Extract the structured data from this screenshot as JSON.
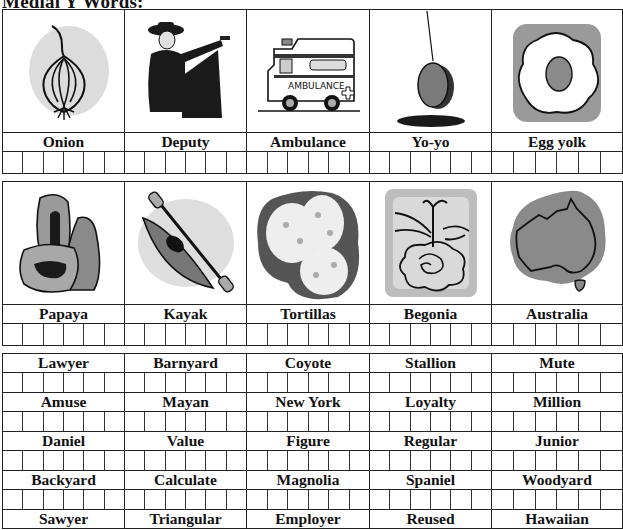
{
  "title": "Medial Y Words:",
  "picture_rows": [
    {
      "items": [
        {
          "label": "Onion",
          "icon": "onion-icon"
        },
        {
          "label": "Deputy",
          "icon": "deputy-icon"
        },
        {
          "label": "Ambulance",
          "icon": "ambulance-icon",
          "icon_text": "AMBULANCE"
        },
        {
          "label": "Yo-yo",
          "icon": "yoyo-icon"
        },
        {
          "label": "Egg yolk",
          "icon": "egg-yolk-icon"
        }
      ]
    },
    {
      "items": [
        {
          "label": "Papaya",
          "icon": "papaya-icon"
        },
        {
          "label": "Kayak",
          "icon": "kayak-icon"
        },
        {
          "label": "Tortillas",
          "icon": "tortillas-icon"
        },
        {
          "label": "Begonia",
          "icon": "begonia-icon"
        },
        {
          "label": "Australia",
          "icon": "australia-icon"
        }
      ]
    }
  ],
  "word_rows": [
    [
      "Lawyer",
      "Barnyard",
      "Coyote",
      "Stallion",
      "Mute"
    ],
    [
      "Amuse",
      "Mayan",
      "New York",
      "Loyalty",
      "Million"
    ],
    [
      "Daniel",
      "Value",
      "Figure",
      "Regular",
      "Junior"
    ],
    [
      "Backyard",
      "Calculate",
      "Magnolia",
      "Spaniel",
      "Woodyard"
    ],
    [
      "Sawyer",
      "Triangular",
      "Employer",
      "Reused",
      "Hawaiian"
    ]
  ],
  "boxes_per_cell": 6,
  "colors": {
    "border": "#222222",
    "ink": "#111111",
    "gray_fill": "#8a8a8a",
    "light_gray": "#d9d9d9"
  }
}
